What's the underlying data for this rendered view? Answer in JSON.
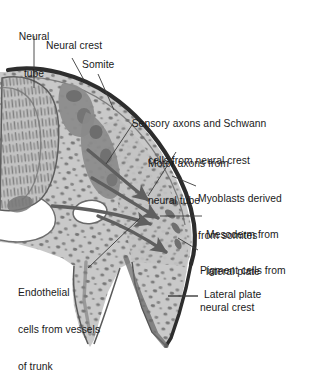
{
  "figure": {
    "type": "anatomical-diagram",
    "style": "grayscale halftone illustration"
  },
  "colors": {
    "background": "#ffffff",
    "tissue_light": "#c9c9c9",
    "tissue_mid": "#b5b5b5",
    "cells_dark": "#808080",
    "outline_dark": "#2f2f2f",
    "outline_mid": "#5a5a5a",
    "text": "#1a1a1a",
    "leader_line": "#3a3a3a",
    "lumen_white": "#ffffff"
  },
  "labels": [
    {
      "id": "neural-tube",
      "line1": "Neural",
      "line2": "tube",
      "align": "center"
    },
    {
      "id": "neural-crest",
      "line1": "Neural crest",
      "line2": "",
      "align": "left"
    },
    {
      "id": "somite",
      "line1": "Somite",
      "line2": "",
      "align": "left"
    },
    {
      "id": "sensory-axons",
      "line1": "Sensory axons and Schwann",
      "line2": "cells from neural crest",
      "align": "center"
    },
    {
      "id": "motor-axons",
      "line1": "Motor axons from",
      "line2": "neural tube",
      "align": "left"
    },
    {
      "id": "myoblasts",
      "line1": "Myoblasts derived",
      "line2": "from somites",
      "align": "left"
    },
    {
      "id": "mesoderm",
      "line1": "Mesoderm from",
      "line2": "lateral plate",
      "align": "left"
    },
    {
      "id": "pigment-cells",
      "line1": "Pigment cells from",
      "line2": "neural crest",
      "align": "left"
    },
    {
      "id": "endothelial",
      "line1": "Endothelial",
      "line2": "cells from vessels",
      "line3": "of trunk",
      "align": "left"
    },
    {
      "id": "lateral-plate",
      "line1": "Lateral plate",
      "line2": "",
      "align": "left"
    }
  ],
  "structures": [
    {
      "id": "neural-tube-wall",
      "name": "neural tube with columnar neuroepithelium"
    },
    {
      "id": "neural-crest-mass",
      "name": "dorsal neural crest cell mass"
    },
    {
      "id": "somite-block",
      "name": "somite"
    },
    {
      "id": "lateral-plate-mesoderm",
      "name": "lateral plate mesoderm"
    },
    {
      "id": "vessel-lumen",
      "name": "dorsal aorta / vessel lumen"
    },
    {
      "id": "limb-bud",
      "name": "limb bud / trunk extension"
    },
    {
      "id": "migration-arrows",
      "name": "neural crest cell migration pathways",
      "count": 4
    }
  ]
}
